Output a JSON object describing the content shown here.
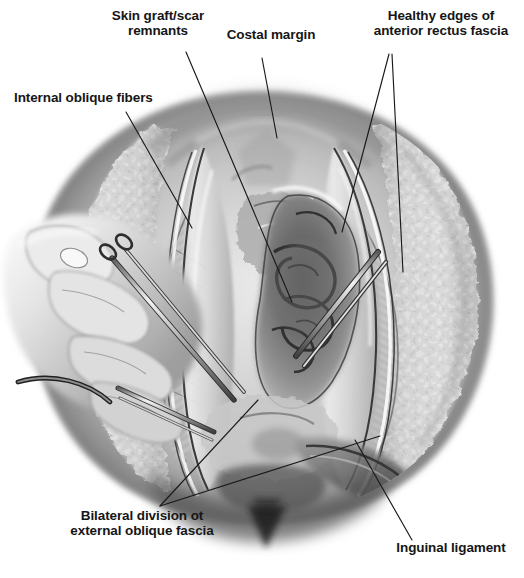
{
  "figure": {
    "type": "medical-illustration",
    "background_color": "#ffffff",
    "ink_color": "#161616",
    "width": 524,
    "height": 578
  },
  "labels": {
    "skin_graft": "Skin graft/scar\nremnants",
    "costal_margin": "Costal margin",
    "healthy_edges": "Healthy edges of\nanterior rectus fascia",
    "internal_oblique": "Internal oblique fibers",
    "bilateral_division": "Bilateral division ot\nexternal oblique fascia",
    "inguinal_ligament": "Inguinal ligament"
  },
  "leader_lines": [
    {
      "name": "skin-graft-leader",
      "points": "186,52 292,302"
    },
    {
      "name": "costal-margin-leader",
      "points": "262,58 277,138"
    },
    {
      "name": "healthy-edges-leader-a",
      "points": "389,54 342,232"
    },
    {
      "name": "healthy-edges-leader-b",
      "points": "392,54 403,272"
    },
    {
      "name": "internal-oblique-leader",
      "points": "126,112 192,228"
    },
    {
      "name": "bilateral-leader-a",
      "points": "160,506 258,400"
    },
    {
      "name": "bilateral-leader-b",
      "points": "160,506 380,436"
    },
    {
      "name": "inguinal-leader",
      "points": "412,540 355,440"
    }
  ],
  "anatomy_regions": [
    {
      "name": "abdominal-wall-body",
      "description": "Oval torso field, mid-gray shaded"
    },
    {
      "name": "subcutaneous-fat-rim-right",
      "description": "Mottled pale fat margin along right edge"
    },
    {
      "name": "subcutaneous-fat-rim-left",
      "description": "Mottled pale fat margin along left edge"
    },
    {
      "name": "midline-defect-opening",
      "description": "Central dark hernia defect with viscera"
    },
    {
      "name": "anterior-rectus-fascia-right",
      "description": "Glistening fascial sheet right of midline"
    },
    {
      "name": "anterior-rectus-fascia-left",
      "description": "Glistening fascial sheet left of midline"
    },
    {
      "name": "internal-oblique-fibers",
      "description": "Striated hatched muscle fibers, left lateral"
    },
    {
      "name": "external-oblique-fibers",
      "description": "Striated hatched muscle fibers, right lateral"
    },
    {
      "name": "costal-margin-ridge",
      "description": "Upper arched rib margin shading"
    },
    {
      "name": "inguinal-ligament-band",
      "description": "Dark inferior oblique band, lower right"
    },
    {
      "name": "pubic-region-shadow",
      "description": "Dark inferior midline notch"
    },
    {
      "name": "skin-graft-scar-tissue",
      "description": "Irregular scarred plaque, mid-upper field"
    }
  ],
  "instruments": [
    {
      "name": "surgeons-hand",
      "description": "Gloved hand entering from left, thumb and fingers"
    },
    {
      "name": "dissecting-scissors",
      "description": "Long scissors held by left hand, angled down-right"
    },
    {
      "name": "tissue-forceps",
      "description": "Forceps grasping fascial edge, lower left"
    },
    {
      "name": "retractor-hook",
      "description": "Curved hook at far left lower"
    },
    {
      "name": "second-scissors",
      "description": "Second instrument crossing right central field"
    }
  ]
}
